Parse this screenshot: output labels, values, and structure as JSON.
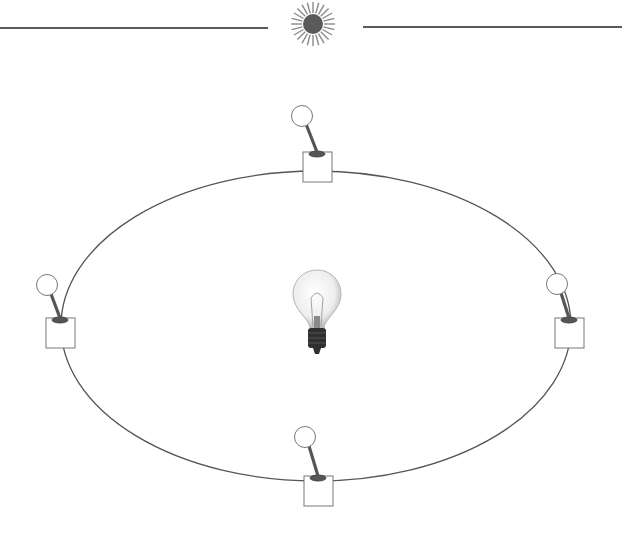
{
  "diagram": {
    "colors": {
      "line": "#555555",
      "sun": "#5a5a5a",
      "bulb_glass": "#e6e6e6",
      "bulb_base": "#2f2f2f",
      "stroke": "#777777"
    },
    "top_rule": {
      "left": {
        "x1": 0,
        "x2": 268,
        "y": 28
      },
      "right": {
        "x1": 363,
        "x2": 622,
        "y": 27
      }
    },
    "sun": {
      "cx": 313,
      "cy": 24,
      "r": 10,
      "rays": 24
    },
    "circuit": {
      "cx": 316,
      "cy": 326,
      "rx": 255,
      "ry": 155
    },
    "bulb": {
      "cx": 317,
      "cy": 310
    },
    "switches": [
      {
        "id": "top",
        "box_x": 303,
        "box_y": 152,
        "knob_cx": 302,
        "knob_cy": 116
      },
      {
        "id": "left",
        "box_x": 46,
        "box_y": 318,
        "knob_cx": 47,
        "knob_cy": 285
      },
      {
        "id": "right",
        "box_x": 555,
        "box_y": 318,
        "knob_cx": 557,
        "knob_cy": 284
      },
      {
        "id": "bottom",
        "box_x": 304,
        "box_y": 476,
        "knob_cx": 305,
        "knob_cy": 437
      }
    ]
  }
}
